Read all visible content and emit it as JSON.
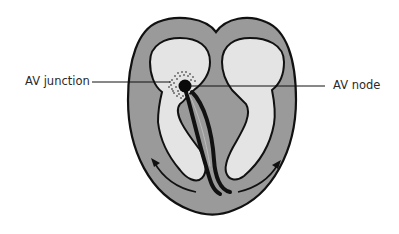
{
  "diagram": {
    "labels": {
      "left": "AV junction",
      "right": "AV node"
    },
    "colors": {
      "background": "#ffffff",
      "myocardium": "#9a9a9a",
      "chamber": "#e4e4e4",
      "outline": "#111111",
      "node": "#0a0a0a",
      "label_text": "#2a2a2a"
    },
    "elements": [
      "outer heart outline",
      "left atrium/ventricle chamber",
      "right atrium/ventricle chamber",
      "AV node (black dot)",
      "AV junction (stippled region)",
      "bundle branches",
      "conduction arrows"
    ]
  }
}
